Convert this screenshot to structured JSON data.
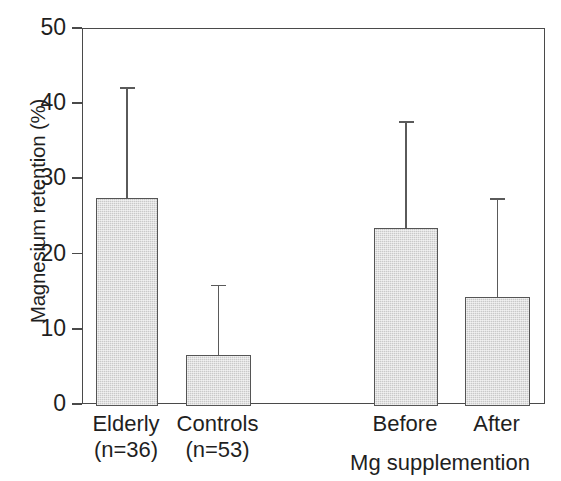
{
  "chart_data": {
    "type": "bar",
    "title": "",
    "xlabel": "Mg supplemention",
    "ylabel": "Magnesium retention (%)",
    "ylim": [
      0,
      50
    ],
    "yticks": [
      0,
      10,
      20,
      30,
      40,
      50
    ],
    "ytick_labels": [
      "0",
      "10",
      "20",
      "30",
      "40",
      "50"
    ],
    "grid": false,
    "legend": "none",
    "categories": [
      "Elderly",
      "Controls",
      "Before",
      "After"
    ],
    "category_sublabels": [
      "(n=36)",
      "(n=53)",
      "",
      ""
    ],
    "values": [
      27.5,
      6.6,
      23.5,
      14.3
    ],
    "error_upper": [
      42.3,
      16.0,
      37.8,
      27.5
    ],
    "error_bars": "upper only (SD)",
    "group_label": "Mg supplemention",
    "bar_fill_color": "#c9c9c9",
    "bar_edge_color": "#555555",
    "axis_color": "#4a4a4a",
    "text_color": "#1f1f1f",
    "background_color": "#ffffff"
  },
  "axis": {
    "y_title": "Magnesium retention (%)"
  },
  "bars": [
    {
      "label": "Elderly",
      "sublabel": "(n=36)",
      "value": 27.5,
      "err_top": 42.3,
      "x_left": 95,
      "width": 62
    },
    {
      "label": "Controls",
      "sublabel": "(n=53)",
      "value": 6.6,
      "err_top": 16.0,
      "x_left": 185,
      "width": 65
    },
    {
      "label": "Before",
      "sublabel": "",
      "value": 23.5,
      "err_top": 37.8,
      "x_left": 373,
      "width": 64
    },
    {
      "label": "After",
      "sublabel": "",
      "value": 14.3,
      "err_top": 27.5,
      "x_left": 464,
      "width": 65
    }
  ],
  "group_label": "Mg supplemention"
}
